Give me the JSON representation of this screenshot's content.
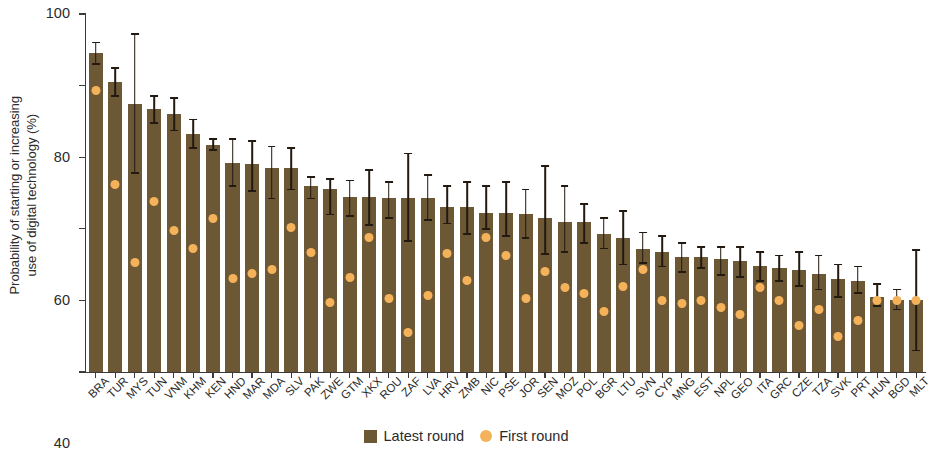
{
  "chart_data": {
    "type": "bar",
    "title": "",
    "subtitle": "",
    "xlabel": "",
    "ylabel": "Probability of starting or increasing\nuse of digital technology (%)",
    "ylim": [
      0,
      100
    ],
    "yticks": [
      0,
      20,
      40,
      60,
      80,
      100
    ],
    "ytick_labels": [
      "0",
      "20",
      "40",
      "60",
      "80",
      "100"
    ],
    "grid": false,
    "legend_position": "bottom-center",
    "legend": [
      {
        "label": "Latest round",
        "marker": "square",
        "color": "#6d5835"
      },
      {
        "label": "First round",
        "marker": "circle",
        "color": "#f4b25a"
      }
    ],
    "categories": [
      "BRA",
      "TUR",
      "MYS",
      "TUN",
      "VNM",
      "KHM",
      "KEN",
      "HND",
      "MAR",
      "MDA",
      "SLV",
      "PAK",
      "ZWE",
      "GTM",
      "XKX",
      "ROU",
      "ZAF",
      "LVA",
      "HRV",
      "ZMB",
      "NIC",
      "PSE",
      "JOR",
      "SEN",
      "MOZ",
      "POL",
      "BGR",
      "LTU",
      "SVN",
      "CYP",
      "MNG",
      "EST",
      "NPL",
      "GEO",
      "ITA",
      "GRC",
      "CZE",
      "TZA",
      "SVK",
      "PRT",
      "HUN",
      "BGD",
      "MLT"
    ],
    "series": [
      {
        "name": "Latest round",
        "marker": "bar",
        "color": "#6d5835",
        "values": [
          89,
          81,
          75,
          73.5,
          72,
          66.5,
          63.5,
          58.5,
          58,
          57,
          57,
          52,
          51,
          49,
          49,
          48.5,
          48.5,
          48.5,
          46,
          46,
          44.5,
          44.5,
          44,
          43,
          42,
          42,
          38.5,
          37.5,
          34.5,
          33.5,
          32,
          32,
          31.5,
          31,
          29.5,
          29,
          28.5,
          27.5,
          26,
          25.5,
          21,
          20,
          20
        ]
      },
      {
        "name": "First round",
        "marker": "circle",
        "color": "#f4b25a",
        "values": [
          78.5,
          52.5,
          30.5,
          47.5,
          39.5,
          34.5,
          43,
          26,
          27.5,
          28.5,
          40.5,
          33.5,
          19.5,
          26.5,
          37.5,
          20.5,
          11,
          21.5,
          33,
          25.5,
          37.5,
          32.5,
          20.5,
          28,
          23.5,
          22,
          17,
          24,
          28.5,
          20,
          19,
          20,
          18,
          16,
          23.5,
          20,
          13,
          17.5,
          10,
          14.5,
          20,
          20,
          20
        ]
      }
    ],
    "error_bars": {
      "series": "Latest round",
      "lower": [
        86,
        77,
        55.5,
        69.5,
        67.5,
        62.5,
        62,
        52,
        50.5,
        48.5,
        51,
        48.5,
        44,
        43.5,
        41,
        43,
        36.5,
        42.5,
        41.5,
        38.5,
        40,
        38,
        37.5,
        33,
        33.5,
        36,
        34.5,
        30,
        30.5,
        29.5,
        28,
        29,
        27,
        26.5,
        25.5,
        25.5,
        24,
        23,
        21,
        22,
        18.5,
        17.5,
        6
      ],
      "upper": [
        92,
        85,
        94.5,
        77,
        76.5,
        70.5,
        65,
        65,
        64.5,
        63,
        62.5,
        54.5,
        54,
        53.5,
        56.5,
        53,
        61,
        55,
        52,
        53,
        52,
        53,
        51,
        57.5,
        52,
        47,
        43,
        45,
        39,
        38,
        36,
        35,
        35,
        35,
        33.5,
        32.5,
        33.5,
        32.5,
        30,
        29.5,
        24.5,
        23,
        34
      ]
    }
  },
  "colors": {
    "bar": "#6d5835",
    "dot": "#f4b25a",
    "axis": "#3b3b3b",
    "error": "#221a11",
    "background": "#ffffff"
  }
}
